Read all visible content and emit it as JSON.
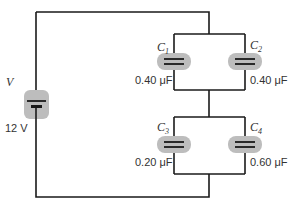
{
  "diagram": {
    "title": "",
    "battery": {
      "symbol": "V",
      "value": "12 V"
    },
    "capacitors": [
      {
        "symbol": "C",
        "subscript": "1",
        "value": "0.40 μF"
      },
      {
        "symbol": "C",
        "subscript": "2",
        "value": "0.40 μF"
      },
      {
        "symbol": "C",
        "subscript": "3",
        "value": "0.20 μF"
      },
      {
        "symbol": "C",
        "subscript": "4",
        "value": "0.60 μF"
      }
    ],
    "colors": {
      "wire": "#1a1a1a",
      "highlight": "#bdbdbd",
      "text": "#333333"
    }
  }
}
